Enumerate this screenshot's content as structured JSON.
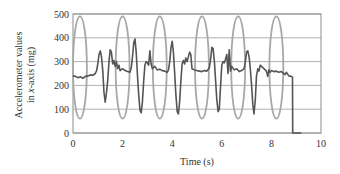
{
  "chart_data": {
    "type": "line",
    "title": "",
    "xlabel": "Time (s)",
    "ylabel_line1": "Accelerometer values",
    "ylabel_line2_prefix": "in ",
    "ylabel_line2_italic": "x",
    "ylabel_line2_suffix": "-axis (mg)",
    "xlim": [
      0,
      10
    ],
    "ylim": [
      0,
      500
    ],
    "x_ticks": [
      0,
      2,
      4,
      6,
      8,
      10
    ],
    "y_ticks": [
      0,
      100,
      200,
      300,
      400,
      500
    ],
    "grid": {
      "horizontal": true,
      "vertical": false
    },
    "legend": null,
    "colors": {
      "signal": "#555555",
      "ellipse": "#a8a8a8",
      "grid": "#b0b0b0",
      "frame": "#8c8c8c",
      "text": "#333333"
    },
    "series": [
      {
        "name": "Accelerometer x-axis",
        "points": [
          [
            0.0,
            240
          ],
          [
            0.1,
            238
          ],
          [
            0.2,
            232
          ],
          [
            0.3,
            236
          ],
          [
            0.4,
            230
          ],
          [
            0.5,
            238
          ],
          [
            0.6,
            240
          ],
          [
            0.7,
            244
          ],
          [
            0.8,
            242
          ],
          [
            0.9,
            250
          ],
          [
            0.95,
            262
          ],
          [
            1.0,
            290
          ],
          [
            1.05,
            330
          ],
          [
            1.1,
            345
          ],
          [
            1.15,
            320
          ],
          [
            1.2,
            260
          ],
          [
            1.25,
            170
          ],
          [
            1.3,
            130
          ],
          [
            1.35,
            170
          ],
          [
            1.4,
            220
          ],
          [
            1.45,
            300
          ],
          [
            1.5,
            350
          ],
          [
            1.55,
            340
          ],
          [
            1.6,
            290
          ],
          [
            1.65,
            305
          ],
          [
            1.7,
            280
          ],
          [
            1.75,
            300
          ],
          [
            1.8,
            270
          ],
          [
            1.85,
            285
          ],
          [
            1.9,
            262
          ],
          [
            2.0,
            270
          ],
          [
            2.1,
            262
          ],
          [
            2.2,
            258
          ],
          [
            2.3,
            255
          ],
          [
            2.35,
            275
          ],
          [
            2.4,
            320
          ],
          [
            2.45,
            380
          ],
          [
            2.5,
            395
          ],
          [
            2.55,
            340
          ],
          [
            2.6,
            240
          ],
          [
            2.65,
            160
          ],
          [
            2.7,
            95
          ],
          [
            2.75,
            85
          ],
          [
            2.8,
            130
          ],
          [
            2.85,
            220
          ],
          [
            2.9,
            285
          ],
          [
            2.95,
            300
          ],
          [
            3.0,
            295
          ],
          [
            3.05,
            285
          ],
          [
            3.1,
            345
          ],
          [
            3.15,
            290
          ],
          [
            3.2,
            270
          ],
          [
            3.3,
            280
          ],
          [
            3.4,
            265
          ],
          [
            3.5,
            268
          ],
          [
            3.6,
            262
          ],
          [
            3.7,
            260
          ],
          [
            3.8,
            255
          ],
          [
            3.85,
            265
          ],
          [
            3.9,
            300
          ],
          [
            3.95,
            360
          ],
          [
            4.0,
            385
          ],
          [
            4.05,
            340
          ],
          [
            4.1,
            250
          ],
          [
            4.15,
            160
          ],
          [
            4.2,
            90
          ],
          [
            4.25,
            80
          ],
          [
            4.3,
            130
          ],
          [
            4.35,
            220
          ],
          [
            4.4,
            290
          ],
          [
            4.45,
            305
          ],
          [
            4.5,
            290
          ],
          [
            4.55,
            315
          ],
          [
            4.6,
            300
          ],
          [
            4.7,
            340
          ],
          [
            4.75,
            330
          ],
          [
            4.8,
            270
          ],
          [
            4.9,
            265
          ],
          [
            5.0,
            262
          ],
          [
            5.1,
            260
          ],
          [
            5.2,
            258
          ],
          [
            5.3,
            262
          ],
          [
            5.4,
            260
          ],
          [
            5.5,
            275
          ],
          [
            5.55,
            310
          ],
          [
            5.6,
            360
          ],
          [
            5.65,
            355
          ],
          [
            5.7,
            300
          ],
          [
            5.75,
            220
          ],
          [
            5.8,
            140
          ],
          [
            5.85,
            90
          ],
          [
            5.9,
            100
          ],
          [
            5.95,
            200
          ],
          [
            6.0,
            285
          ],
          [
            6.05,
            300
          ],
          [
            6.1,
            295
          ],
          [
            6.15,
            310
          ],
          [
            6.2,
            330
          ],
          [
            6.25,
            250
          ],
          [
            6.3,
            350
          ],
          [
            6.35,
            260
          ],
          [
            6.4,
            280
          ],
          [
            6.5,
            265
          ],
          [
            6.6,
            270
          ],
          [
            6.7,
            258
          ],
          [
            6.8,
            262
          ],
          [
            6.9,
            270
          ],
          [
            6.95,
            300
          ],
          [
            7.0,
            340
          ],
          [
            7.05,
            345
          ],
          [
            7.1,
            320
          ],
          [
            7.15,
            270
          ],
          [
            7.2,
            200
          ],
          [
            7.25,
            120
          ],
          [
            7.3,
            80
          ],
          [
            7.35,
            140
          ],
          [
            7.4,
            240
          ],
          [
            7.45,
            270
          ],
          [
            7.5,
            260
          ],
          [
            7.55,
            285
          ],
          [
            7.6,
            280
          ],
          [
            7.7,
            270
          ],
          [
            7.8,
            260
          ],
          [
            7.85,
            238
          ],
          [
            7.9,
            265
          ],
          [
            7.95,
            255
          ],
          [
            8.0,
            262
          ],
          [
            8.1,
            258
          ],
          [
            8.2,
            260
          ],
          [
            8.3,
            255
          ],
          [
            8.4,
            258
          ],
          [
            8.5,
            250
          ],
          [
            8.55,
            245
          ],
          [
            8.6,
            255
          ],
          [
            8.7,
            240
          ],
          [
            8.8,
            238
          ],
          [
            8.85,
            235
          ],
          [
            8.86,
            0
          ],
          [
            9.2,
            0
          ]
        ]
      }
    ],
    "annotations": {
      "type": "ellipses",
      "description": "Gray ellipses highlighting steady-state regions",
      "items": [
        {
          "cx": 0.28,
          "cy": 275,
          "rx": 0.28,
          "ry": 215
        },
        {
          "cx": 2.0,
          "cy": 275,
          "rx": 0.28,
          "ry": 215
        },
        {
          "cx": 3.5,
          "cy": 275,
          "rx": 0.28,
          "ry": 215
        },
        {
          "cx": 5.2,
          "cy": 275,
          "rx": 0.28,
          "ry": 215
        },
        {
          "cx": 6.66,
          "cy": 275,
          "rx": 0.28,
          "ry": 215
        },
        {
          "cx": 8.2,
          "cy": 275,
          "rx": 0.28,
          "ry": 215
        }
      ]
    }
  }
}
